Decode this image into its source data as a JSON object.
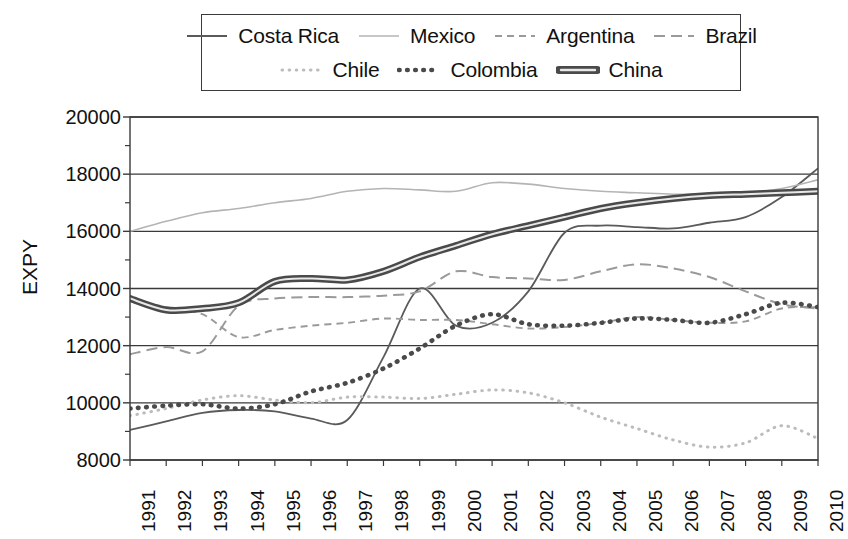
{
  "chart_data": {
    "type": "line",
    "title": "",
    "xlabel": "",
    "ylabel": "EXPY",
    "ylim": [
      8000,
      20000
    ],
    "ytick_values": [
      8000,
      10000,
      12000,
      14000,
      16000,
      18000,
      20000
    ],
    "ytick_labels": [
      "8000",
      "10000",
      "12000",
      "14000",
      "16000",
      "18000",
      "20000"
    ],
    "minor_tick_step": 1000,
    "grid": "horizontal-major",
    "legend_position": "top-outside",
    "x": [
      1991,
      1992,
      1993,
      1994,
      1995,
      1996,
      1997,
      1998,
      1999,
      2000,
      2001,
      2002,
      2003,
      2004,
      2005,
      2006,
      2007,
      2008,
      2009,
      2010
    ],
    "xtick_labels": [
      "1991",
      "1992",
      "1993",
      "1994",
      "1995",
      "1996",
      "1997",
      "1998",
      "1999",
      "2000",
      "2001",
      "2002",
      "2003",
      "2004",
      "2005",
      "2006",
      "2007",
      "2008",
      "2009",
      "2010"
    ],
    "series": [
      {
        "name": "Costa Rica",
        "style": "solid-thin",
        "color": "#5a5a5a",
        "values": [
          9050,
          9350,
          9650,
          9750,
          9700,
          9450,
          9400,
          11600,
          14000,
          12700,
          12800,
          13900,
          15950,
          16200,
          16150,
          16100,
          16300,
          16500,
          17200,
          18200
        ]
      },
      {
        "name": "Mexico",
        "style": "solid-faint",
        "color": "#b4b4b4",
        "values": [
          16000,
          16350,
          16650,
          16800,
          17000,
          17150,
          17400,
          17500,
          17450,
          17400,
          17700,
          17650,
          17500,
          17400,
          17350,
          17300,
          17300,
          17350,
          17500,
          17800
        ]
      },
      {
        "name": "Argentina",
        "style": "dashed-short",
        "color": "#9a9a9a",
        "values": [
          13600,
          13350,
          13100,
          12300,
          12550,
          12700,
          12800,
          12950,
          12900,
          12900,
          12750,
          12600,
          12650,
          12800,
          13000,
          12900,
          12800,
          12850,
          13300,
          13350
        ]
      },
      {
        "name": "Brazil",
        "style": "dashed-long",
        "color": "#9a9a9a",
        "values": [
          11700,
          11950,
          11800,
          13400,
          13650,
          13700,
          13700,
          13750,
          13900,
          14600,
          14400,
          14350,
          14300,
          14600,
          14850,
          14700,
          14400,
          13900,
          13450,
          13300
        ]
      },
      {
        "name": "Chile",
        "style": "dotted-faint",
        "color": "#bcbcbc",
        "values": [
          9550,
          9800,
          10100,
          10250,
          10100,
          10000,
          10200,
          10200,
          10150,
          10300,
          10450,
          10350,
          10000,
          9500,
          9100,
          8700,
          8450,
          8600,
          9200,
          8750
        ]
      },
      {
        "name": "Colombia",
        "style": "dotted-bold",
        "color": "#4a4a4a",
        "values": [
          9800,
          9900,
          9950,
          9800,
          9950,
          10400,
          10700,
          11200,
          11900,
          12700,
          13100,
          12750,
          12700,
          12800,
          12950,
          12900,
          12800,
          13100,
          13500,
          13350
        ]
      },
      {
        "name": "China",
        "style": "thick-outline",
        "color": "#4a4a4a",
        "values": [
          13650,
          13250,
          13300,
          13500,
          14250,
          14350,
          14300,
          14600,
          15100,
          15500,
          15900,
          16200,
          16500,
          16800,
          17000,
          17150,
          17250,
          17300,
          17350,
          17400
        ]
      }
    ]
  },
  "legend": {
    "entries": [
      {
        "label": "Costa Rica",
        "swatch": "solid-thin"
      },
      {
        "label": "Mexico",
        "swatch": "solid-faint"
      },
      {
        "label": "Argentina",
        "swatch": "dashed-short"
      },
      {
        "label": "Brazil",
        "swatch": "dashed-long"
      },
      {
        "label": "Chile",
        "swatch": "dotted-faint"
      },
      {
        "label": "Colombia",
        "swatch": "dotted-bold"
      },
      {
        "label": "China",
        "swatch": "thick-outline"
      }
    ]
  }
}
